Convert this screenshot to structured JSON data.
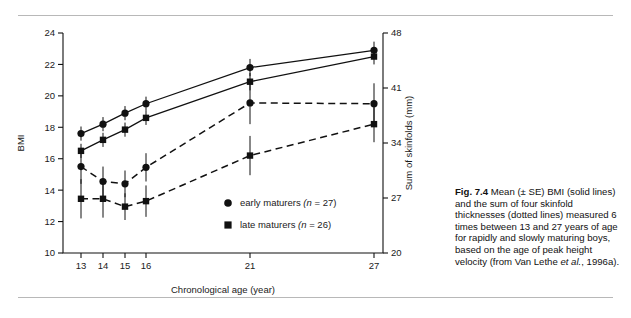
{
  "figure": {
    "caption_label": "Fig. 7.4",
    "caption_text_1": "Mean (± SE) BMI (solid lines) and the sum of four skinfold thicknesses (dotted lines) measured 6 times between 13 and 27 years of age for rapidly and slowly maturing boys, based on the age of peak height velocity (from Van Lethe ",
    "caption_italic": "et al.",
    "caption_text_2": ", 1996a)."
  },
  "chart_data": {
    "type": "line",
    "title": "",
    "xlabel": "Chronological age (year)",
    "ylabel": "BMI",
    "y2label": "Sum of skinfolds (mm)",
    "x": [
      13,
      14,
      15,
      16,
      21,
      27
    ],
    "xticklabels": [
      "13",
      "14",
      "15",
      "16",
      "21",
      "27"
    ],
    "ylim": [
      10,
      24
    ],
    "yticks": [
      10,
      12,
      14,
      16,
      18,
      20,
      22,
      24
    ],
    "yticklabels": [
      "10",
      "12",
      "14",
      "16",
      "18",
      "20",
      "22",
      "24"
    ],
    "y2lim": [
      20,
      48
    ],
    "y2ticks": [
      20,
      27,
      34,
      41,
      48
    ],
    "y2ticklabels": [
      "20",
      "27",
      "34",
      "41",
      "48"
    ],
    "grid": false,
    "legend_position": "inside-right",
    "series": [
      {
        "name": "early maturers BMI",
        "legend": "early maturers",
        "n_label": "(n = 27)",
        "marker": "circle",
        "linestyle": "solid",
        "axis": "left",
        "values": [
          17.6,
          18.2,
          18.9,
          19.5,
          21.8,
          22.9
        ],
        "errors": [
          0.45,
          0.45,
          0.45,
          0.45,
          0.55,
          0.55
        ]
      },
      {
        "name": "late maturers BMI",
        "legend": "late maturers",
        "n_label": "(n = 26)",
        "marker": "square",
        "linestyle": "solid",
        "axis": "left",
        "values": [
          16.5,
          17.2,
          17.85,
          18.6,
          20.9,
          22.5
        ],
        "errors": [
          0.45,
          0.45,
          0.45,
          0.45,
          0.55,
          0.5
        ]
      },
      {
        "name": "early maturers skinfolds",
        "legend": "early maturers",
        "n_label": "(n = 27)",
        "marker": "circle",
        "linestyle": "dashed",
        "axis": "right",
        "values": [
          15.5,
          14.55,
          14.4,
          15.45,
          19.55,
          19.5
        ],
        "errors": [
          1.1,
          0.95,
          0.85,
          0.9,
          1.35,
          1.3
        ]
      },
      {
        "name": "late maturers skinfolds",
        "legend": "late maturers",
        "n_label": "(n = 26)",
        "marker": "square",
        "linestyle": "dashed",
        "axis": "right",
        "values": [
          13.45,
          13.45,
          12.95,
          13.3,
          16.2,
          18.2
        ],
        "errors": [
          1.25,
          1.2,
          0.85,
          1.0,
          1.25,
          1.15
        ]
      }
    ],
    "legend_entries": [
      {
        "marker": "circle",
        "label": "early maturers",
        "n_label": "(n = 27)"
      },
      {
        "marker": "square",
        "label": "late maturers",
        "n_label": "(n = 26)"
      }
    ]
  }
}
